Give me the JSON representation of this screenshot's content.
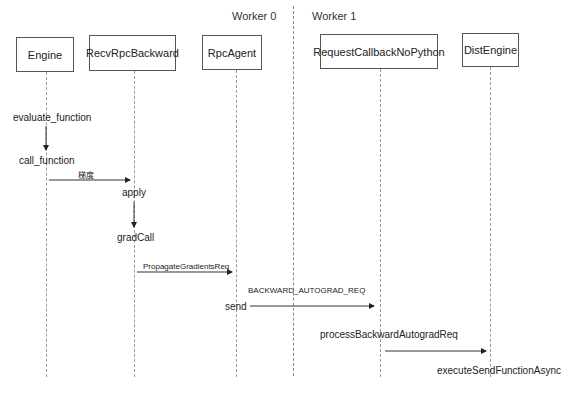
{
  "workers": [
    {
      "label": "Worker 0"
    },
    {
      "label": "Worker 1"
    }
  ],
  "participants": [
    {
      "name": "Engine"
    },
    {
      "name": "RecvRpcBackward"
    },
    {
      "name": "RpcAgent"
    },
    {
      "name": "RequestCallbackNoPython"
    },
    {
      "name": "DistEngine"
    }
  ],
  "steps": [
    {
      "label": "evaluate_function"
    },
    {
      "label": "call_function"
    },
    {
      "label": "apply"
    },
    {
      "label": "gradCall"
    },
    {
      "label": "send"
    },
    {
      "label": "processBackwardAutogradReq"
    },
    {
      "label": "executeSendFunctionAsync"
    }
  ],
  "messages": [
    {
      "label": "梯度"
    },
    {
      "label": "PropagateGradientsReq"
    },
    {
      "label": "BACKWARD_AUTOGRAD_REQ"
    }
  ]
}
